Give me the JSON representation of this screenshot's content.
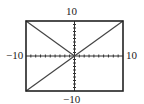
{
  "chart_data": {
    "type": "line",
    "title": "",
    "xlabel": "",
    "ylabel": "",
    "window": {
      "xmin": -10,
      "xmax": 10,
      "ymin": -10,
      "ymax": 10,
      "xscl": 1,
      "yscl": 1
    },
    "xlim": [
      -10,
      10
    ],
    "ylim": [
      -10,
      10
    ],
    "grid": false,
    "axes_ticks_every": 1,
    "tick_labels": {
      "top": "10",
      "bottom": "−10",
      "left": "−10",
      "right": "10"
    },
    "series": [
      {
        "name": "y = x",
        "x": [
          -10,
          10
        ],
        "values": [
          -10,
          10
        ],
        "domain": [
          -10,
          10
        ]
      },
      {
        "name": "y = -x (x ≤ 0)",
        "x": [
          -10,
          0
        ],
        "values": [
          10,
          0
        ],
        "domain": [
          -10,
          0
        ]
      }
    ],
    "legend": null
  },
  "labels": {
    "top": "10",
    "bottom": "−10",
    "left": "−10",
    "right": "10"
  },
  "colors": {
    "frame": "#222222",
    "axes": "#333333",
    "curve": "#444444"
  }
}
